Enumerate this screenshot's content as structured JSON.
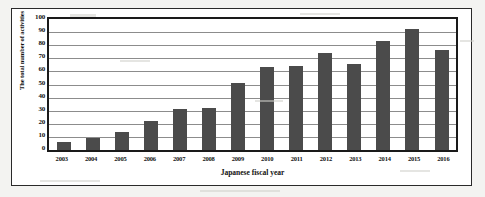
{
  "chart_data": {
    "type": "bar",
    "title": "",
    "subtitle": "",
    "xlabel": "Japanese fiscal year",
    "ylabel": "The total number of activities",
    "categories": [
      "2003",
      "2004",
      "2005",
      "2006",
      "2007",
      "2008",
      "2009",
      "2010",
      "2011",
      "2012",
      "2013",
      "2014",
      "2015",
      "2016"
    ],
    "values": [
      6,
      9,
      14,
      22,
      31,
      32,
      51,
      63,
      64,
      74,
      66,
      83,
      92,
      76
    ],
    "ylim": [
      0,
      100
    ],
    "ytick_labels": [
      "100",
      "90",
      "80",
      "70",
      "60",
      "50",
      "40",
      "30",
      "20",
      "10",
      "0"
    ],
    "ytick_values": [
      100,
      90,
      80,
      70,
      60,
      50,
      40,
      30,
      20,
      10,
      0
    ],
    "grid": true,
    "grid_axis": "y",
    "legend": false,
    "legend_position": "none",
    "bar_color": "#4b4b4b",
    "gridline_color": "#8c8c8c",
    "axis_color": "#1a1a1a",
    "plot_background": "#ffffff",
    "figure_background": "#f3f3f1"
  }
}
